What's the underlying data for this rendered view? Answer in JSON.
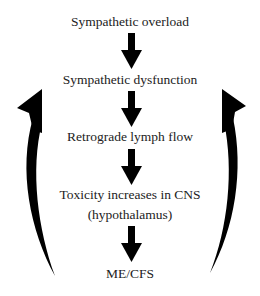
{
  "diagram": {
    "nodes": [
      {
        "id": "n1",
        "label": "Sympathetic overload",
        "top": 14
      },
      {
        "id": "n2",
        "label": "Sympathetic dysfunction",
        "top": 72
      },
      {
        "id": "n3",
        "label": "Retrograde lymph flow",
        "top": 129
      },
      {
        "id": "n4a",
        "label": "Toxicity increases in CNS",
        "top": 187
      },
      {
        "id": "n4b",
        "label": "(hypothalamus)",
        "top": 207
      },
      {
        "id": "n5",
        "label": "ME/CFS",
        "top": 266
      }
    ],
    "edges": [
      {
        "from": "n1",
        "to": "n2",
        "type": "down-arrow"
      },
      {
        "from": "n2",
        "to": "n3",
        "type": "down-arrow"
      },
      {
        "from": "n3",
        "to": "n4a",
        "type": "down-arrow"
      },
      {
        "from": "n4b",
        "to": "n5",
        "type": "down-arrow"
      },
      {
        "from": "n5",
        "to": "n2",
        "type": "feedback-curved-arrow-left"
      },
      {
        "from": "n5",
        "to": "n2",
        "type": "feedback-curved-arrow-right"
      }
    ],
    "colors": {
      "arrow": "#000000",
      "text": "#222222",
      "background": "#ffffff"
    }
  }
}
